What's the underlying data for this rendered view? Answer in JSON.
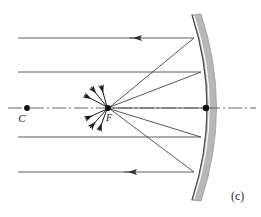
{
  "figure": {
    "panel_label": "(c)",
    "caption_kind": "concave-mirror-ray-diagram",
    "background_color": "#ffffff",
    "width": 261,
    "height": 217
  },
  "labels": {
    "center_of_curvature": "C",
    "focal_point": "F"
  },
  "colors": {
    "ray_stroke": "#4a4a4a",
    "reflected_stroke": "#3a3a3a",
    "axis_stroke": "#555555",
    "mirror_band": "#b7b7b7",
    "mirror_band_edge": "#9a9a9a",
    "mirror_surface_line": "#4a4a4a",
    "point_fill": "#111111",
    "label_fill": "#1a1a1a"
  },
  "chart_data": {
    "type": "scatter",
    "title": "(c)",
    "xlabel": "",
    "ylabel": "",
    "xlim": [
      0,
      261
    ],
    "ylim": [
      217,
      0
    ],
    "grid": false,
    "legend": null,
    "optical_axis": {
      "y": 108,
      "x_start": 8,
      "x_end": 256,
      "style": "dash-dot"
    },
    "points": [
      {
        "name": "C",
        "label": "C",
        "x": 27,
        "y": 108,
        "label_dx": -5,
        "label_dy": 14
      },
      {
        "name": "F",
        "label": "F",
        "x": 108,
        "y": 108,
        "label_dx": 1,
        "label_dy": 13
      },
      {
        "name": "vertex",
        "label": "",
        "x": 206,
        "y": 108,
        "label_dx": 0,
        "label_dy": 0
      }
    ],
    "mirror": {
      "top": {
        "x": 192,
        "y": 15
      },
      "vertex": {
        "x": 207,
        "y": 108
      },
      "bottom": {
        "x": 192,
        "y": 200
      },
      "band_thickness": 9,
      "concave_toward": "left"
    },
    "incoming_rays": [
      {
        "id": "ray-1",
        "y": 38,
        "x_start": 18,
        "x_end": 194,
        "arrow_x": 138
      },
      {
        "id": "ray-2",
        "y": 72,
        "x_start": 18,
        "x_end": 201,
        "arrow_x": null
      },
      {
        "id": "ray-3",
        "y": 137,
        "x_start": 18,
        "x_end": 201,
        "arrow_x": null
      },
      {
        "id": "ray-4",
        "y": 172,
        "x_start": 18,
        "x_end": 194,
        "arrow_x": 133
      }
    ],
    "reflected_rays": [
      {
        "id": "refl-1",
        "from_x": 194,
        "from_y": 38,
        "to_x": 110,
        "to_y": 107
      },
      {
        "id": "refl-2",
        "from_x": 201,
        "from_y": 72,
        "to_x": 110,
        "to_y": 107
      },
      {
        "id": "refl-3",
        "from_x": 201,
        "from_y": 137,
        "to_x": 110,
        "to_y": 109
      },
      {
        "id": "refl-4",
        "from_x": 194,
        "from_y": 172,
        "to_x": 110,
        "to_y": 109
      },
      {
        "id": "refl-5",
        "from_x": 206,
        "from_y": 108,
        "to_x": 110,
        "to_y": 108
      }
    ],
    "focal_arrows": [
      {
        "id": "f-arrow-1",
        "from_x": 107,
        "from_y": 107,
        "to_x": 84,
        "to_y": 95
      },
      {
        "id": "f-arrow-2",
        "from_x": 107,
        "from_y": 107,
        "to_x": 91,
        "to_y": 87
      },
      {
        "id": "f-arrow-3",
        "from_x": 107,
        "from_y": 107,
        "to_x": 101,
        "to_y": 85
      },
      {
        "id": "f-arrow-4",
        "from_x": 107,
        "from_y": 109,
        "to_x": 85,
        "to_y": 119
      },
      {
        "id": "f-arrow-5",
        "from_x": 107,
        "from_y": 109,
        "to_x": 90,
        "to_y": 128
      },
      {
        "id": "f-arrow-6",
        "from_x": 107,
        "from_y": 109,
        "to_x": 99,
        "to_y": 131
      }
    ]
  }
}
